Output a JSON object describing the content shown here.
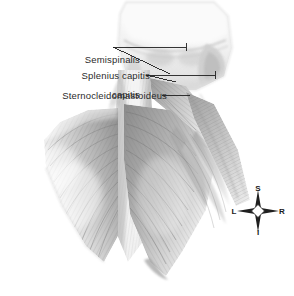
{
  "figure": {
    "background_color": "#ffffff",
    "ink_color": "#2b2b2b",
    "labels": [
      {
        "id": "semispinalis",
        "name": "semispinalis-capitis",
        "text": "Semispinalis\ncapitis",
        "line1": "Semispinalis",
        "line2": "capitis"
      },
      {
        "id": "splenius",
        "name": "splenius-capitis",
        "text": "Splenius capitis",
        "line1": "Splenius capitis",
        "line2": ""
      },
      {
        "id": "sternocleidomastoideus",
        "name": "sternocleidomastoideus",
        "text": "Sternocleidomastoideus",
        "line1": "Sternocleidomastoideus",
        "line2": ""
      }
    ],
    "compass": {
      "name": "anatomical-orientation-compass",
      "superior": "S",
      "inferior": "I",
      "left": "L",
      "right": "R"
    }
  }
}
